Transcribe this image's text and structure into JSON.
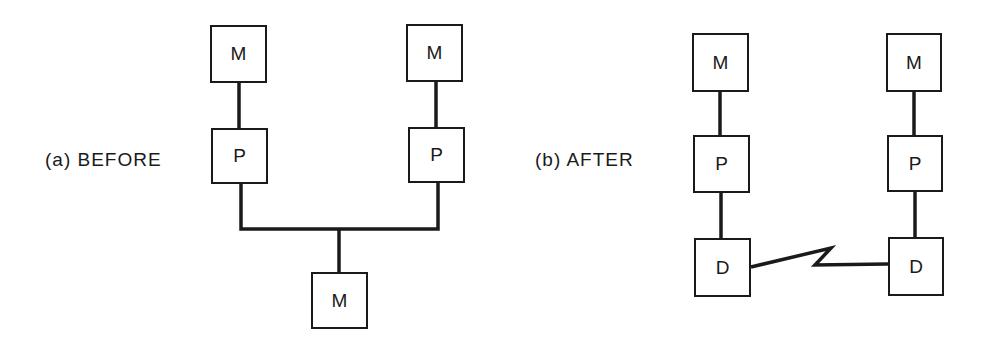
{
  "diagram": {
    "panel_a": {
      "label": "(a)  BEFORE",
      "nodes": [
        {
          "id": "a-m1",
          "text": "M",
          "x": 210,
          "y": 25,
          "w": 57,
          "h": 58
        },
        {
          "id": "a-m2",
          "text": "M",
          "x": 406,
          "y": 24,
          "w": 57,
          "h": 58
        },
        {
          "id": "a-p1",
          "text": "P",
          "x": 211,
          "y": 128,
          "w": 57,
          "h": 56
        },
        {
          "id": "a-p2",
          "text": "P",
          "x": 408,
          "y": 127,
          "w": 57,
          "h": 56
        },
        {
          "id": "a-m3",
          "text": "M",
          "x": 311,
          "y": 272,
          "w": 57,
          "h": 57
        }
      ],
      "edges": [
        {
          "from": "a-m1",
          "to": "a-p1"
        },
        {
          "from": "a-m2",
          "to": "a-p2"
        },
        {
          "from": "a-p1",
          "to": "bus"
        },
        {
          "from": "a-p2",
          "to": "bus"
        },
        {
          "from": "bus",
          "to": "a-m3"
        }
      ]
    },
    "panel_b": {
      "label": "(b)  AFTER",
      "nodes": [
        {
          "id": "b-m1",
          "text": "M",
          "x": 692,
          "y": 33,
          "w": 57,
          "h": 59
        },
        {
          "id": "b-m2",
          "text": "M",
          "x": 886,
          "y": 33,
          "w": 56,
          "h": 59
        },
        {
          "id": "b-p1",
          "text": "P",
          "x": 693,
          "y": 135,
          "w": 57,
          "h": 58
        },
        {
          "id": "b-p2",
          "text": "P",
          "x": 887,
          "y": 135,
          "w": 56,
          "h": 57
        },
        {
          "id": "b-d1",
          "text": "D",
          "x": 694,
          "y": 238,
          "w": 57,
          "h": 59
        },
        {
          "id": "b-d2",
          "text": "D",
          "x": 888,
          "y": 237,
          "w": 56,
          "h": 59
        }
      ],
      "edges": [
        {
          "from": "b-m1",
          "to": "b-p1"
        },
        {
          "from": "b-m2",
          "to": "b-p2"
        },
        {
          "from": "b-p1",
          "to": "b-d1"
        },
        {
          "from": "b-p2",
          "to": "b-d2"
        },
        {
          "from": "b-d1",
          "to": "b-d2",
          "style": "zigzag-communication-link"
        }
      ]
    }
  }
}
